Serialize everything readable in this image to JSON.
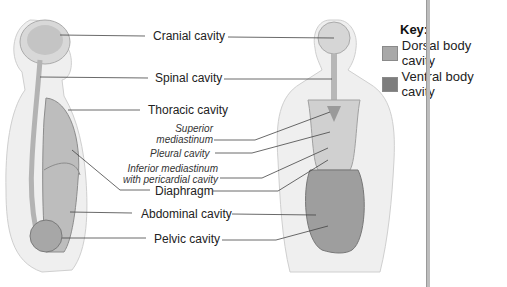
{
  "figure": {
    "views": [
      "lateral-view",
      "anterior-view"
    ]
  },
  "labels": {
    "cranial": "Cranial cavity",
    "spinal": "Spinal cavity",
    "thoracic": "Thoracic cavity",
    "superior_mediastinum_1": "Superior",
    "superior_mediastinum_2": "mediastinum",
    "pleural": "Pleural cavity",
    "inferior_mediastinum_1": "Inferior mediastinum",
    "inferior_mediastinum_2": "with pericardial cavity",
    "diaphragm": "Diaphragm",
    "abdominal": "Abdominal cavity",
    "pelvic": "Pelvic cavity"
  },
  "key": {
    "title": "Key:",
    "items": [
      {
        "label": "Dorsal body cavity",
        "color": "#a8a8a8"
      },
      {
        "label": "Ventral body cavity",
        "color": "#7d7d7d"
      }
    ]
  },
  "colors": {
    "body_fill": "#ececec",
    "body_outline": "#c8c8c8",
    "organ_fill": "#9a9a9a",
    "leader_line": "#444444"
  }
}
